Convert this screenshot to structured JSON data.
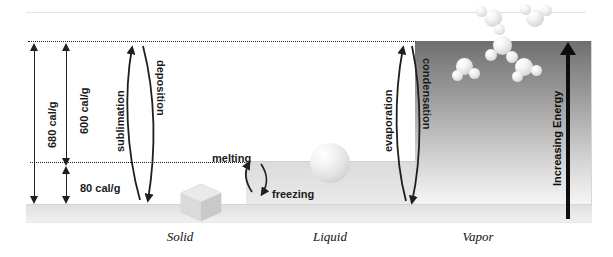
{
  "figure": {
    "axis_right_label": "Increasing Energy"
  },
  "energy_measures": [
    {
      "name": "total",
      "label": "680 cal/g",
      "from": "solid",
      "to": "vapor"
    },
    {
      "name": "vaporization",
      "label": "600 cal/g",
      "from": "liquid",
      "to": "vapor"
    },
    {
      "name": "fusion",
      "label": "80 cal/g",
      "from": "solid",
      "to": "liquid"
    }
  ],
  "transitions": {
    "sublimation": "sublimation",
    "deposition": "deposition",
    "melting": "melting",
    "freezing": "freezing",
    "evaporation": "evaporation",
    "condensation": "condensation"
  },
  "states": [
    {
      "name": "solid",
      "label": "Solid"
    },
    {
      "name": "liquid",
      "label": "Liquid"
    },
    {
      "name": "vapor",
      "label": "Vapor"
    }
  ],
  "colors": {
    "ink": "#1f1f1f",
    "energy_arrow": "#0d0d0d",
    "vapor_dark": "#6e6e6e",
    "vapor_light": "#f8f8f8",
    "base_band": "#e4e4e4"
  }
}
